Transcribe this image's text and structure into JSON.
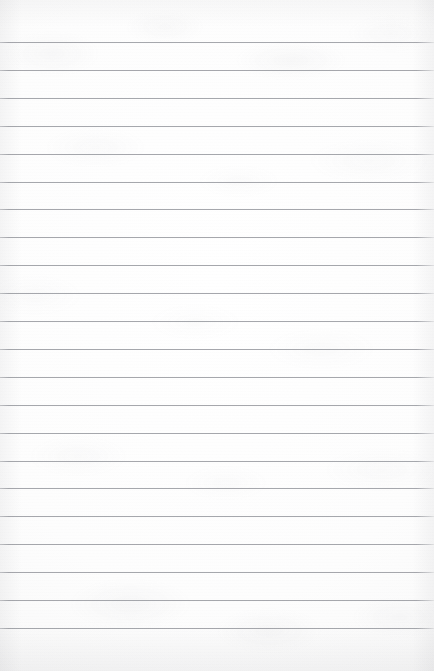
{
  "page": {
    "kind": "lined-notebook-page",
    "width": 434,
    "height": 671,
    "content_text": "",
    "paper_color": "#fbfbfb",
    "paper_highlight_color": "#ffffff",
    "paper_edge_color": "#f2f2f3",
    "texture": "mottled-paper-grain"
  },
  "rules": {
    "line_color": "#969aa0",
    "line_thickness_px": 1,
    "line_spacing_px": 27.9,
    "first_line_y_px": 42,
    "last_line_y_px": 628,
    "top_margin_px": 42,
    "bottom_margin_px": 43,
    "left_inset_px": 0,
    "right_inset_px": 0,
    "count": 22,
    "y_positions": [
      42,
      69.9,
      97.8,
      125.7,
      153.6,
      181.5,
      209.4,
      237.3,
      265.2,
      293.1,
      321.0,
      348.9,
      376.8,
      404.7,
      432.6,
      460.5,
      488.4,
      516.3,
      544.2,
      572.1,
      600.0,
      627.9
    ]
  }
}
